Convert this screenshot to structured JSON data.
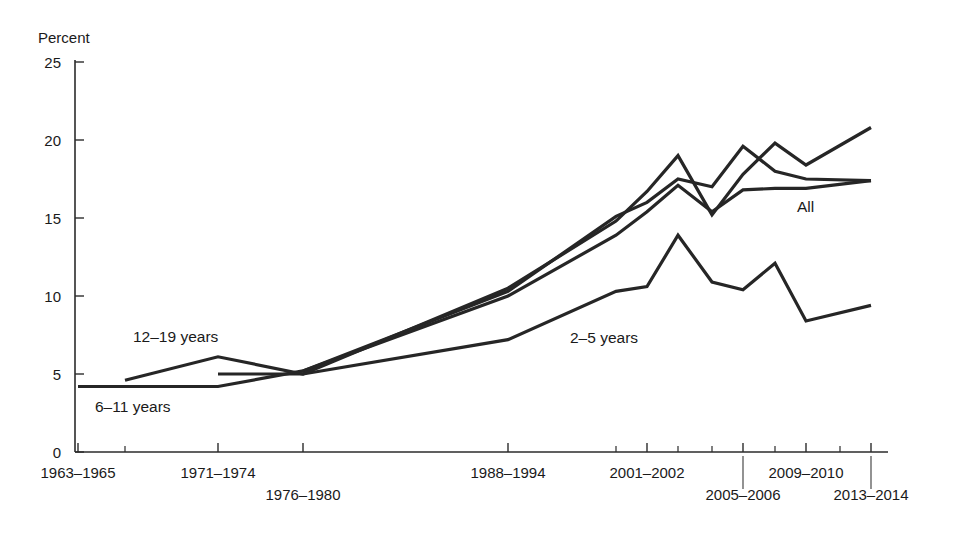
{
  "chart_data": {
    "type": "line",
    "title": "",
    "xlabel": "",
    "ylabel": "Percent",
    "ylim": [
      0,
      25
    ],
    "yticks": [
      0,
      5,
      10,
      15,
      20,
      25
    ],
    "grid": false,
    "legend_position": "inline-annotations",
    "categories": [
      "1963–1965",
      "1971–1974",
      "1976–1980",
      "1988–1994",
      "1999–2000",
      "2001–2002",
      "2003–2004",
      "2005–2006",
      "2007–2008",
      "2009–2010",
      "2011–2012",
      "2013–2014"
    ],
    "x_tick_labels": [
      {
        "label": "1963–1965",
        "row": 0
      },
      {
        "label": "1971–1974",
        "row": 0
      },
      {
        "label": "1976–1980",
        "row": 1
      },
      {
        "label": "1988–1994",
        "row": 0
      },
      {
        "label": "2001–2002",
        "row": 0
      },
      {
        "label": "2005–2006",
        "row": 1
      },
      {
        "label": "2009–2010",
        "row": 0
      },
      {
        "label": "2013–2014",
        "row": 1
      }
    ],
    "series": [
      {
        "name": "All",
        "label": "All",
        "color": "#262626",
        "x": [
          "1976–1980",
          "1988–1994",
          "1999–2000",
          "2001–2002",
          "2003–2004",
          "2005–2006",
          "2007–2008",
          "2009–2010",
          "2011–2012",
          "2013–2014"
        ],
        "values": [
          5.2,
          10.0,
          13.9,
          15.4,
          17.1,
          15.4,
          16.8,
          16.9,
          16.9,
          17.4
        ]
      },
      {
        "name": "2-5 years",
        "label": "2–5 years",
        "color": "#262626",
        "x": [
          "1971–1974",
          "1976–1980",
          "1988–1994",
          "1999–2000",
          "2001–2002",
          "2003–2004",
          "2005–2006",
          "2007–2008",
          "2009–2010",
          "2011–2012",
          "2013–2014"
        ],
        "values": [
          5.0,
          5.0,
          7.2,
          10.3,
          10.6,
          13.9,
          10.9,
          10.4,
          12.1,
          8.4,
          9.4
        ]
      },
      {
        "name": "6-11 years",
        "label": "6–11 years",
        "color": "#262626",
        "x": [
          "1963–1965",
          "1971–1974",
          "1976–1980",
          "1988–1994",
          "1999–2000",
          "2001–2002",
          "2003–2004",
          "2005–2006",
          "2007–2008",
          "2009–2010",
          "2011–2012",
          "2013–2014"
        ],
        "values": [
          4.2,
          4.2,
          5.2,
          10.3,
          15.1,
          16.0,
          17.5,
          17.0,
          19.6,
          18.0,
          17.5,
          17.4
        ]
      },
      {
        "name": "12-19 years",
        "label": "12–19 years",
        "color": "#262626",
        "x": [
          "1966–1970",
          "1971–1974",
          "1976–1980",
          "1988–1994",
          "1999–2000",
          "2001–2002",
          "2003–2004",
          "2005–2006",
          "2007–2008",
          "2009–2010",
          "2011–2012",
          "2013–2014"
        ],
        "values": [
          4.6,
          6.1,
          5.0,
          10.5,
          14.8,
          16.7,
          19.0,
          15.2,
          17.8,
          19.8,
          18.4,
          20.8
        ]
      }
    ],
    "annotations": [
      {
        "text": "12–19 years",
        "x_px": 133,
        "y_px": 342,
        "name": "series-label-12-19"
      },
      {
        "text": "6–11 years",
        "x_px": 95,
        "y_px": 412,
        "name": "series-label-6-11"
      },
      {
        "text": "2–5 years",
        "x_px": 570,
        "y_px": 343,
        "name": "series-label-2-5"
      },
      {
        "text": "All",
        "x_px": 797,
        "y_px": 212,
        "name": "series-label-all"
      }
    ]
  }
}
